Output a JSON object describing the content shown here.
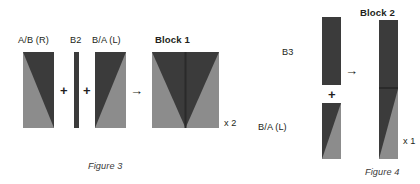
{
  "figures": [
    {
      "id": "figure-3",
      "caption": "Figure 3",
      "multiplier": "x 2",
      "parts": [
        {
          "name": "A/B (R)",
          "label": "A/B (R)"
        },
        {
          "name": "B2",
          "label": "B2"
        },
        {
          "name": "B/A (L)",
          "label": "B/A (L)"
        }
      ],
      "result": "Block 1",
      "operators": {
        "plus": "+",
        "arrow": "→"
      }
    },
    {
      "id": "figure-4",
      "caption": "Figure 4",
      "multiplier": "x 1",
      "parts": [
        {
          "name": "B3",
          "label": "B3"
        },
        {
          "name": "B/A (L)",
          "label": "B/A (L)"
        }
      ],
      "result": "Block 2",
      "operators": {
        "plus": "+",
        "arrow": "→"
      }
    }
  ],
  "colors": {
    "dark": "#3b3b3b",
    "light": "#8c8c8c",
    "seam": "#2a2a2a",
    "text": "#231f20",
    "background": "#ffffff"
  }
}
